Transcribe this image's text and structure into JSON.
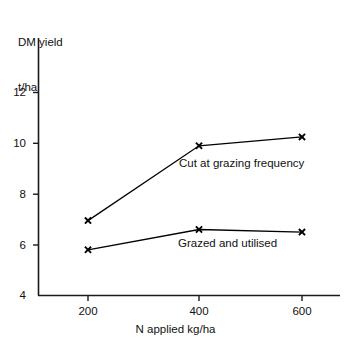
{
  "chart_data": {
    "type": "line",
    "title": "",
    "xlabel": "N applied kg/ha",
    "ylabel_line1": "DM yield",
    "ylabel_line2": "t/ha",
    "x": [
      200,
      400,
      600
    ],
    "xtick_labels": [
      "200",
      "400",
      "600"
    ],
    "ytick_labels": [
      "4",
      "6",
      "8",
      "10",
      "12"
    ],
    "yticks": [
      4,
      6,
      8,
      10,
      12
    ],
    "xlim": [
      120,
      700
    ],
    "ylim": [
      4,
      14.1
    ],
    "grid": false,
    "legend_position": "inline-annotation",
    "marker": "x",
    "line_color": "#000000",
    "background_color": "#ffffff",
    "series": [
      {
        "name": "Cut at grazing frequency",
        "values": [
          6.95,
          9.9,
          10.25
        ],
        "annotation": "Cut at grazing frequency"
      },
      {
        "name": "Grazed and utilised",
        "values": [
          5.8,
          6.6,
          6.5
        ],
        "annotation": "Grazed and utilised"
      }
    ]
  },
  "axes": {
    "y_title_line1": "DM yield",
    "y_title_line2": "t/ha",
    "x_title": "N applied kg/ha",
    "y_tick_0": "4",
    "y_tick_1": "6",
    "y_tick_2": "8",
    "y_tick_3": "10",
    "y_tick_4": "12",
    "x_tick_0": "200",
    "x_tick_1": "400",
    "x_tick_2": "600"
  },
  "annotations": {
    "upper": "Cut at grazing frequency",
    "lower": "Grazed and utilised"
  }
}
